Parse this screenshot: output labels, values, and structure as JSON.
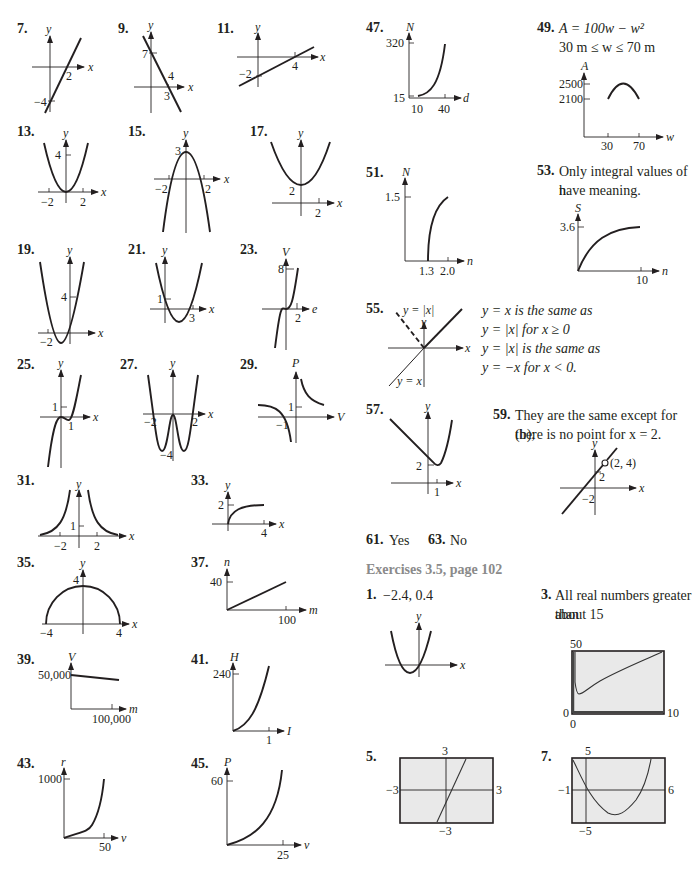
{
  "left_column": {
    "items": [
      {
        "num": "7.",
        "ylabel": "y",
        "xlabel": "x",
        "ticks": [
          "2",
          "−4"
        ]
      },
      {
        "num": "9.",
        "ylabel": "y",
        "xlabel": "x",
        "ticks": [
          "7",
          "4",
          "3"
        ]
      },
      {
        "num": "11.",
        "ylabel": "y",
        "xlabel": "x",
        "ticks": [
          "−2",
          "4"
        ]
      },
      {
        "num": "13.",
        "ylabel": "y",
        "xlabel": "x",
        "ticks": [
          "4",
          "−2",
          "2"
        ]
      },
      {
        "num": "15.",
        "ylabel": "y",
        "xlabel": "x",
        "ticks": [
          "3",
          "−2",
          "2"
        ]
      },
      {
        "num": "17.",
        "ylabel": "y",
        "xlabel": "x",
        "ticks": [
          "2",
          "2"
        ]
      },
      {
        "num": "19.",
        "ylabel": "y",
        "xlabel": "x",
        "ticks": [
          "4",
          "−2"
        ]
      },
      {
        "num": "21.",
        "ylabel": "y",
        "xlabel": "x",
        "ticks": [
          "1",
          "3"
        ]
      },
      {
        "num": "23.",
        "ylabel": "V",
        "xlabel": "e",
        "ticks": [
          "8",
          "2"
        ]
      },
      {
        "num": "25.",
        "ylabel": "y",
        "xlabel": "x",
        "ticks": [
          "1",
          "1"
        ]
      },
      {
        "num": "27.",
        "ylabel": "y",
        "xlabel": "x",
        "ticks": [
          "−2",
          "2",
          "−4"
        ]
      },
      {
        "num": "29.",
        "ylabel": "P",
        "xlabel": "V",
        "ticks": [
          "1",
          "−1"
        ]
      },
      {
        "num": "31.",
        "ylabel": "y",
        "xlabel": "x",
        "ticks": [
          "1",
          "−2",
          "2"
        ]
      },
      {
        "num": "33.",
        "ylabel": "y",
        "xlabel": "x",
        "ticks": [
          "2",
          "4"
        ]
      },
      {
        "num": "35.",
        "ylabel": "y",
        "xlabel": "x",
        "ticks": [
          "4",
          "−4",
          "4"
        ]
      },
      {
        "num": "37.",
        "ylabel": "n",
        "xlabel": "m",
        "ticks": [
          "40",
          "100"
        ]
      },
      {
        "num": "39.",
        "ylabel": "V",
        "xlabel": "m",
        "ticks": [
          "50,000",
          "100,000"
        ]
      },
      {
        "num": "41.",
        "ylabel": "H",
        "xlabel": "I",
        "ticks": [
          "240",
          "1"
        ]
      },
      {
        "num": "43.",
        "ylabel": "r",
        "xlabel": "v",
        "ticks": [
          "1000",
          "50"
        ]
      },
      {
        "num": "45.",
        "ylabel": "P",
        "xlabel": "v",
        "ticks": [
          "60",
          "25"
        ]
      }
    ]
  },
  "right_column": {
    "ex47": {
      "num": "47.",
      "ylabel": "N",
      "xlabel": "d",
      "ticks": [
        "320",
        "15",
        "10",
        "40"
      ]
    },
    "ex49": {
      "num": "49.",
      "line1": "A = 100w − w²",
      "line2": "30 m ≤ w ≤ 70 m",
      "ylabel": "A",
      "xlabel": "w",
      "ticks": [
        "2500",
        "2100",
        "30",
        "70"
      ]
    },
    "ex51": {
      "num": "51.",
      "ylabel": "N",
      "xlabel": "n",
      "ticks": [
        "1.5",
        "1.3",
        "2.0"
      ]
    },
    "ex53": {
      "num": "53.",
      "line1": "Only integral values of n",
      "line2": "have meaning.",
      "ylabel": "S",
      "xlabel": "n",
      "ticks": [
        "3.6",
        "10"
      ]
    },
    "ex55": {
      "num": "55.",
      "label_abs": "y = |x|",
      "label_id": "y = x",
      "ylabel": "y",
      "xlabel": "x",
      "lines": [
        "y = x is the same as",
        "y = |x| for x ≥ 0",
        "y = |x| is the same as",
        "y = −x for x < 0."
      ]
    },
    "ex57": {
      "num": "57.",
      "ylabel": "y",
      "xlabel": "x",
      "ticks": [
        "2",
        "1"
      ]
    },
    "ex59": {
      "num": "59.",
      "line1": "They are the same except for (b);",
      "line2": "there is no point for x = 2.",
      "ylabel": "y",
      "xlabel": "x",
      "ticks": [
        "2",
        "−2"
      ],
      "point": "(2, 4)"
    },
    "ex61": {
      "num": "61.",
      "answer": "Yes"
    },
    "ex63": {
      "num": "63.",
      "answer": "No"
    },
    "section_heading": "Exercises 3.5, page 102",
    "s1": {
      "num": "1.",
      "answer": "−2.4, 0.4",
      "ylabel": "y",
      "xlabel": "x"
    },
    "s3": {
      "num": "3.",
      "line1": "All real numbers greater than",
      "line2": "about 15",
      "ymax": "50",
      "ymin": "0",
      "xmin": "0",
      "xmax": "10"
    },
    "s5": {
      "num": "5.",
      "ymax": "3",
      "ymin": "−3",
      "xmin": "−3",
      "xmax": "3"
    },
    "s7": {
      "num": "7.",
      "ymax": "5",
      "ymin": "−5",
      "xmin": "−1",
      "xmax": "6"
    }
  }
}
